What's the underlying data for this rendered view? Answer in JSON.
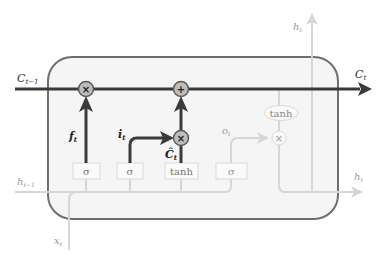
{
  "diagram": {
    "type": "LSTM cell",
    "colors": {
      "cell_fill": "#f5f5f5",
      "cell_border": "#6e6e6e",
      "dark_path": "#3a3a3a",
      "light_path": "#d6d6d6",
      "op_fill": "#bdbdbd",
      "gate_border": "#d9d9d9"
    },
    "labels": {
      "c_prev": "C",
      "c_prev_sub": "t−1",
      "c_next": "C",
      "c_next_sub": "t",
      "h_top": "h",
      "h_top_sub": "t",
      "h_right": "h",
      "h_right_sub": "t",
      "h_prev": "h",
      "h_prev_sub": "t−1",
      "x_in": "x",
      "x_in_sub": "t",
      "forget": "f",
      "forget_sub": "t",
      "input": "i",
      "input_sub": "t",
      "candidate": "Ĉ",
      "candidate_sub": "t",
      "output": "o",
      "output_sub": "t"
    },
    "gates": [
      {
        "id": "forget-gate",
        "label": "σ"
      },
      {
        "id": "input-gate",
        "label": "σ"
      },
      {
        "id": "candidate-gate",
        "label": "tanh"
      },
      {
        "id": "output-gate",
        "label": "σ"
      }
    ],
    "ops": {
      "forget_mul": "×",
      "add": "+",
      "input_mul": "×",
      "output_mul": "×",
      "output_tanh": "tanh"
    }
  }
}
